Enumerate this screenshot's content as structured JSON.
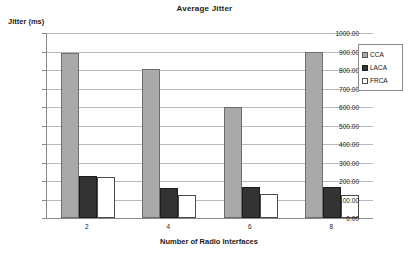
{
  "chart_data": {
    "type": "bar",
    "title": "Average Jitter",
    "xlabel": "Number of Radio Interfaces",
    "ylabel": "Jitter (ms)",
    "categories": [
      "2",
      "4",
      "6",
      "8"
    ],
    "series": [
      {
        "name": "CCA",
        "color": "#a9a9a9",
        "values": [
          890,
          805,
          600,
          895
        ]
      },
      {
        "name": "LACA",
        "color": "#333333",
        "values": [
          225,
          160,
          170,
          165
        ]
      },
      {
        "name": "FRCA",
        "color": "#ffffff",
        "values": [
          220,
          125,
          130,
          125
        ]
      }
    ],
    "ylim": [
      0,
      1000
    ],
    "ytick_step": 100,
    "ytick_labels": [
      "1000.00",
      "900.00",
      "800.00",
      "700.00",
      "600.00",
      "500.00",
      "400.00",
      "300.00",
      "200.00",
      "100.00",
      "0.00"
    ],
    "grid": true,
    "legend_position": "right"
  }
}
